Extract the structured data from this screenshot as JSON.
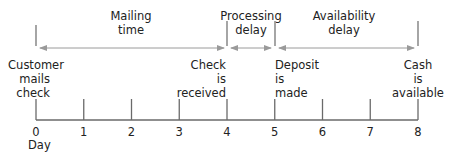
{
  "axis": {
    "label": "Day",
    "ticks": [
      "0",
      "1",
      "2",
      "3",
      "4",
      "5",
      "6",
      "7",
      "8"
    ]
  },
  "intervals": [
    {
      "name": "mailing-time",
      "lines": [
        "Mailing",
        "time"
      ],
      "from_day": 0,
      "to_day": 4
    },
    {
      "name": "processing-delay",
      "lines": [
        "Processing",
        "delay"
      ],
      "from_day": 4,
      "to_day": 5
    },
    {
      "name": "availability-delay",
      "lines": [
        "Availability",
        "delay"
      ],
      "from_day": 5,
      "to_day": 8
    }
  ],
  "events": [
    {
      "name": "customer-mails-check",
      "day": 0,
      "lines": [
        "Customer",
        "mails",
        "check"
      ],
      "align": "center"
    },
    {
      "name": "check-is-received",
      "day": 4,
      "lines": [
        "Check",
        "is",
        "received"
      ],
      "align": "right"
    },
    {
      "name": "deposit-is-made",
      "day": 5,
      "lines": [
        "Deposit",
        "is",
        "made"
      ],
      "align": "left"
    },
    {
      "name": "cash-is-available",
      "day": 8,
      "lines": [
        "Cash",
        "is",
        "available"
      ],
      "align": "center"
    }
  ],
  "colors": {
    "line": "#6a6a6a",
    "arrow": "#9a9a9a",
    "text": "#222222"
  }
}
